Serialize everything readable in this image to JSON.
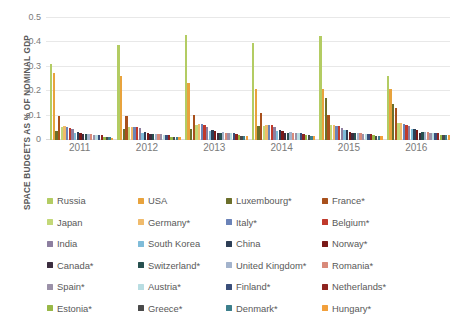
{
  "chart_data": {
    "type": "bar",
    "title": "",
    "subtitle": "",
    "xlabel": "",
    "ylabel": "SPACE BUDGETS AS % OF NOMINAL GDP",
    "ylim": [
      0,
      0.5
    ],
    "yticks": [
      "0",
      "0.1",
      "0.2",
      "0.3",
      "0.4",
      "0.5"
    ],
    "ytick_values": [
      0,
      0.1,
      0.2,
      0.3,
      0.4,
      0.5
    ],
    "grid": true,
    "legend_position": "bottom",
    "categories": [
      "2011",
      "2012",
      "2013",
      "2014",
      "2015",
      "2016"
    ],
    "series": [
      {
        "name": "Russia",
        "color": "#b3cc63",
        "values": [
          0.31,
          0.39,
          0.43,
          0.396,
          0.428,
          0.263
        ]
      },
      {
        "name": "USA",
        "color": "#e8a33d",
        "values": [
          0.276,
          0.261,
          0.232,
          0.211,
          0.211,
          0.209
        ]
      },
      {
        "name": "Luxembourg*",
        "color": "#6b6f2b",
        "values": [
          0.036,
          0.045,
          0.046,
          0.058,
          0.172,
          0.148
        ]
      },
      {
        "name": "France*",
        "color": "#a8501c",
        "values": [
          0.1,
          0.098,
          0.104,
          0.111,
          0.104,
          0.131
        ]
      },
      {
        "name": "Japan",
        "color": "#c3d878",
        "values": [
          0.054,
          0.053,
          0.062,
          0.059,
          0.06,
          0.068
        ]
      },
      {
        "name": "Germany*",
        "color": "#f0bb6c",
        "values": [
          0.057,
          0.055,
          0.066,
          0.063,
          0.06,
          0.069
        ]
      },
      {
        "name": "Italy*",
        "color": "#6b83b8",
        "values": [
          0.052,
          0.052,
          0.065,
          0.063,
          0.057,
          0.066
        ]
      },
      {
        "name": "Belgium*",
        "color": "#c0392b",
        "values": [
          0.05,
          0.053,
          0.062,
          0.06,
          0.056,
          0.063
        ]
      },
      {
        "name": "India",
        "color": "#8d7fa0",
        "values": [
          0.047,
          0.048,
          0.055,
          0.054,
          0.049,
          0.056
        ]
      },
      {
        "name": "South Korea",
        "color": "#7fbcd9",
        "values": [
          0.027,
          0.03,
          0.035,
          0.036,
          0.039,
          0.047
        ]
      },
      {
        "name": "China",
        "color": "#2d3e55",
        "values": [
          0.033,
          0.034,
          0.04,
          0.04,
          0.043,
          0.045
        ]
      },
      {
        "name": "Norway*",
        "color": "#7a1a18",
        "values": [
          0.03,
          0.029,
          0.035,
          0.035,
          0.033,
          0.043
        ]
      },
      {
        "name": "Canada*",
        "color": "#3b2d3f",
        "values": [
          0.025,
          0.024,
          0.03,
          0.03,
          0.027,
          0.03
        ]
      },
      {
        "name": "Switzerland*",
        "color": "#27504f",
        "values": [
          0.024,
          0.023,
          0.03,
          0.03,
          0.028,
          0.031
        ]
      },
      {
        "name": "United Kingdom*",
        "color": "#a3b3cc",
        "values": [
          0.024,
          0.025,
          0.031,
          0.031,
          0.029,
          0.032
        ]
      },
      {
        "name": "Romania*",
        "color": "#d98a7a",
        "values": [
          0.023,
          0.024,
          0.03,
          0.03,
          0.028,
          0.031
        ]
      },
      {
        "name": "Spain*",
        "color": "#9b91a8",
        "values": [
          0.022,
          0.023,
          0.028,
          0.028,
          0.026,
          0.029
        ]
      },
      {
        "name": "Austria*",
        "color": "#b8dde2",
        "values": [
          0.021,
          0.022,
          0.027,
          0.027,
          0.026,
          0.029
        ]
      },
      {
        "name": "Finland*",
        "color": "#3a4e7a",
        "values": [
          0.021,
          0.022,
          0.027,
          0.027,
          0.026,
          0.028
        ]
      },
      {
        "name": "Netherlands*",
        "color": "#8e2420",
        "values": [
          0.02,
          0.021,
          0.026,
          0.026,
          0.025,
          0.027
        ]
      },
      {
        "name": "Estonia*",
        "color": "#98b847",
        "values": [
          0.013,
          0.014,
          0.019,
          0.019,
          0.019,
          0.022
        ]
      },
      {
        "name": "Greece*",
        "color": "#4a4a4a",
        "values": [
          0.012,
          0.014,
          0.018,
          0.019,
          0.018,
          0.021
        ]
      },
      {
        "name": "Denmark*",
        "color": "#3c7f8c",
        "values": [
          0.012,
          0.013,
          0.018,
          0.018,
          0.018,
          0.02
        ]
      },
      {
        "name": "Hungary*",
        "color": "#f2a03c",
        "values": [
          0.01,
          0.012,
          0.016,
          0.016,
          0.016,
          0.019
        ]
      }
    ]
  },
  "axis": {
    "y_title": "SPACE BUDGETS AS % OF NOMINAL GDP"
  }
}
